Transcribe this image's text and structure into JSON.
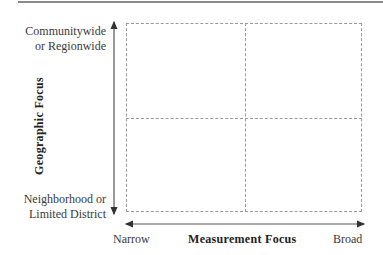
{
  "diagram": {
    "type": "2x2 quadrant matrix",
    "y_axis": {
      "title": "Geographic Focus",
      "top_label_line1": "Communitywide",
      "top_label_line2": "or Regionwide",
      "bottom_label_line1": "Neighborhood or",
      "bottom_label_line2": "Limited District"
    },
    "x_axis": {
      "title": "Measurement Focus",
      "left_label": "Narrow",
      "right_label": "Broad"
    },
    "quadrants": [
      "",
      "",
      "",
      ""
    ],
    "colors": {
      "lines": "#9a9a9a",
      "arrows": "#333333",
      "text": "#3a3a3a"
    }
  }
}
